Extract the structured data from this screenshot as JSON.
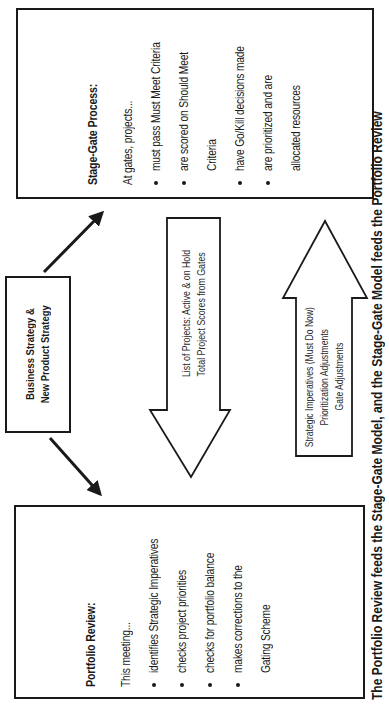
{
  "diagram": {
    "stage_gate": {
      "title": "Stage-Gate Process:",
      "intro": "At gates, projects...",
      "bullets": [
        {
          "line1": "must pass Must Meet Criteria"
        },
        {
          "line1": "are scored on Should Meet",
          "line2": "Criteria"
        },
        {
          "line1": "have Go/Kill decisions made"
        },
        {
          "line1": "are prioritized and are",
          "line2": "allocated resources"
        }
      ]
    },
    "business_strategy": {
      "line1": "Business Strategy &",
      "line2": "New Product Strategy"
    },
    "down_arrow": {
      "line1": "List of Projects: Active & on Hold",
      "line2": "Total Project Scores from Gates"
    },
    "up_arrow": {
      "line1": "Strategic Imperatives (Must Do Now)",
      "line2": "Prioritization Adjustments",
      "line3": "Gate Adjustments"
    },
    "portfolio_review": {
      "title": "Portfolio Review:",
      "intro": "This meeting...",
      "bullets": [
        {
          "line1": "identifies Strategic Imperatives"
        },
        {
          "line1": "checks project priorities"
        },
        {
          "line1": "checks for portfolio balance"
        },
        {
          "line1": "makes corrections to the",
          "line2": "Gating Scheme"
        }
      ]
    },
    "caption": "The Portfolio Review feeds the Stage-Gate Model, and the Stage-Gate Model feeds the Portfolio Review"
  },
  "colors": {
    "ink": "#1a1a1a",
    "background": "#ffffff"
  }
}
